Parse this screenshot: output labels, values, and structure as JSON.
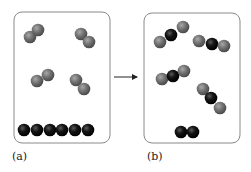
{
  "colors": {
    "gray_atom": "#6e6e6e",
    "gray_atom_highlight": "#9a9a9a",
    "black_atom": "#111111",
    "black_atom_highlight": "#555555",
    "box_stroke": "#8a8a8a",
    "arrow": "#222222"
  },
  "panels": [
    {
      "label": "(a)",
      "box": {
        "x": 14,
        "y": 12,
        "w": 96,
        "h": 131,
        "r": 8
      },
      "molecules": [
        {
          "type": "diatomic-gray",
          "atoms": [
            {
              "x": 30,
              "y": 37,
              "c": "gray"
            },
            {
              "x": 38,
              "y": 30,
              "c": "gray"
            }
          ]
        },
        {
          "type": "diatomic-gray",
          "atoms": [
            {
              "x": 81,
              "y": 34,
              "c": "gray"
            },
            {
              "x": 89,
              "y": 42,
              "c": "gray"
            }
          ]
        },
        {
          "type": "diatomic-gray",
          "atoms": [
            {
              "x": 37,
              "y": 81,
              "c": "gray"
            },
            {
              "x": 48,
              "y": 75,
              "c": "gray"
            }
          ]
        },
        {
          "type": "diatomic-gray",
          "atoms": [
            {
              "x": 76,
              "y": 80,
              "c": "gray"
            },
            {
              "x": 84,
              "y": 89,
              "c": "gray"
            }
          ]
        },
        {
          "type": "black-row",
          "atoms": [
            {
              "x": 24,
              "y": 130,
              "c": "black"
            },
            {
              "x": 37,
              "y": 130,
              "c": "black"
            },
            {
              "x": 50,
              "y": 130,
              "c": "black"
            },
            {
              "x": 62,
              "y": 130,
              "c": "black"
            },
            {
              "x": 75,
              "y": 130,
              "c": "black"
            },
            {
              "x": 88,
              "y": 130,
              "c": "black"
            }
          ]
        }
      ]
    },
    {
      "label": "(b)",
      "box": {
        "x": 144,
        "y": 13,
        "w": 96,
        "h": 130,
        "r": 8
      },
      "molecules": [
        {
          "type": "triatomic",
          "atoms": [
            {
              "x": 160,
              "y": 42,
              "c": "gray"
            },
            {
              "x": 171,
              "y": 35,
              "c": "black"
            },
            {
              "x": 183,
              "y": 27,
              "c": "gray"
            }
          ]
        },
        {
          "type": "triatomic",
          "atoms": [
            {
              "x": 199,
              "y": 41,
              "c": "gray"
            },
            {
              "x": 212,
              "y": 44,
              "c": "black"
            },
            {
              "x": 224,
              "y": 46,
              "c": "gray"
            }
          ]
        },
        {
          "type": "triatomic",
          "atoms": [
            {
              "x": 162,
              "y": 79,
              "c": "gray"
            },
            {
              "x": 173,
              "y": 76,
              "c": "black"
            },
            {
              "x": 184,
              "y": 71,
              "c": "gray"
            }
          ]
        },
        {
          "type": "triatomic",
          "atoms": [
            {
              "x": 203,
              "y": 89,
              "c": "gray"
            },
            {
              "x": 211,
              "y": 98,
              "c": "black"
            },
            {
              "x": 220,
              "y": 108,
              "c": "gray"
            }
          ]
        },
        {
          "type": "diatomic-black",
          "atoms": [
            {
              "x": 181,
              "y": 132,
              "c": "black"
            },
            {
              "x": 193,
              "y": 132,
              "c": "black"
            }
          ]
        }
      ]
    }
  ],
  "arrow": {
    "x1": 114,
    "y1": 77,
    "x2": 137,
    "y2": 77
  }
}
